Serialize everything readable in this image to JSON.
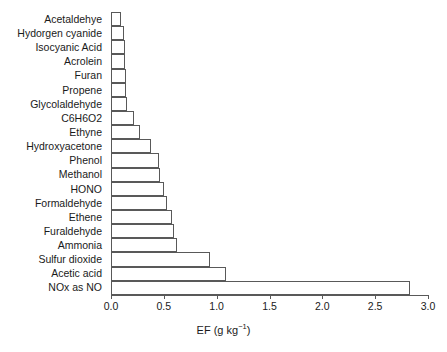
{
  "chart_data": {
    "type": "bar",
    "orientation": "horizontal",
    "title": "",
    "subtitle": "",
    "xlabel": "EF (g kg⁻¹)",
    "ylabel": "",
    "xlim": [
      0.0,
      3.0
    ],
    "grid": false,
    "legend": null,
    "axis_title_parts": {
      "base": "EF (g kg",
      "exponent": "−1",
      "close": ")"
    },
    "xticks": [
      0.0,
      0.5,
      1.0,
      1.5,
      2.0,
      2.5,
      3.0
    ],
    "xtick_labels": [
      "0.0",
      "0.5",
      "1.0",
      "1.5",
      "2.0",
      "2.5",
      "3.0"
    ],
    "categories": [
      "Acetaldehye",
      "Hydorgen cyanide",
      "Isocyanic Acid",
      "Acrolein",
      "Furan",
      "Propene",
      "Glycolaldehyde",
      "C6H6O2",
      "Ethyne",
      "Hydroxyacetone",
      "Phenol",
      "Methanol",
      "HONO",
      "Formaldehyde",
      "Ethene",
      "Furaldehyde",
      "Ammonia",
      "Sulfur dioxide",
      "Acetic acid",
      "NOx as NO"
    ],
    "values": [
      0.09,
      0.12,
      0.13,
      0.13,
      0.14,
      0.14,
      0.15,
      0.22,
      0.27,
      0.38,
      0.45,
      0.46,
      0.5,
      0.53,
      0.58,
      0.6,
      0.62,
      0.94,
      1.09,
      2.83
    ],
    "bar_style": {
      "fill": "#ffffff",
      "edge": "#595959",
      "edge_width": 1
    }
  }
}
